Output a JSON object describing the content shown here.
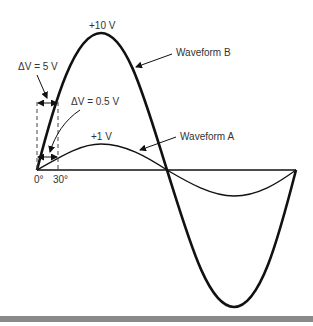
{
  "labels": {
    "peak_b": "+10 V",
    "waveform_b": "Waveform B",
    "delta_v_b": "ΔV = 5 V",
    "delta_v_a": "ΔV = 0.5 V",
    "peak_a": "+1 V",
    "waveform_a": "Waveform A",
    "angle_zero": "0°",
    "angle_thirty": "30°"
  },
  "waveforms": [
    {
      "name": "Waveform B",
      "amplitude_v": 10,
      "delta_v_at_30deg": 5,
      "stroke": "#111111",
      "stroke_width": 2.6
    },
    {
      "name": "Waveform A",
      "amplitude_v": 1,
      "delta_v_at_30deg": 0.5,
      "stroke": "#111111",
      "stroke_width": 1.3
    }
  ],
  "colors": {
    "line": "#111111",
    "text": "#333333",
    "dashed": "#444444",
    "bottom_bar": "#8a8a8a"
  }
}
